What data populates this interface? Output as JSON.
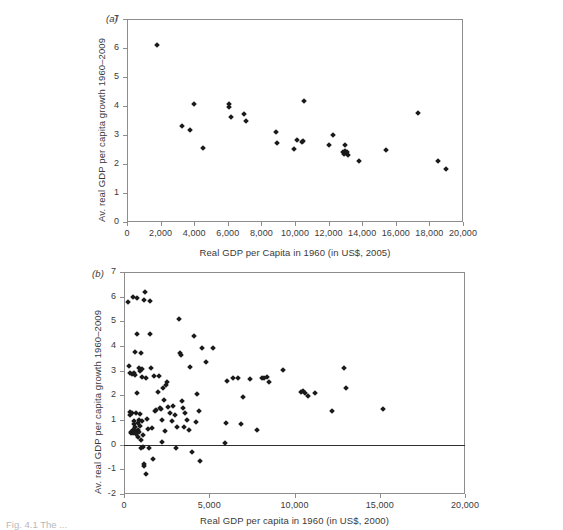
{
  "figure": {
    "caption_fragment": "Fig. 4.1 The ..."
  },
  "chart_data": [
    {
      "type": "scatter",
      "panel_label": "(a)",
      "title": "",
      "xlabel": "Real GDP per Capita in 1960 (in US$, 2005)",
      "ylabel": "Av. real GDP per capita growth 1960–2009",
      "xlim": [
        0,
        20000
      ],
      "ylim": [
        0,
        7
      ],
      "xticks": [
        0,
        2000,
        4000,
        6000,
        8000,
        10000,
        12000,
        14000,
        16000,
        18000,
        20000
      ],
      "xticklabels": [
        "0",
        "2,000",
        "4,000",
        "6,000",
        "8,000",
        "10,000",
        "12,000",
        "14,000",
        "16,000",
        "18,000",
        "20,000"
      ],
      "yticks": [
        0,
        1,
        2,
        3,
        4,
        5,
        6,
        7
      ],
      "yticklabels": [
        "0",
        "1",
        "2",
        "3",
        "4",
        "5",
        "6",
        "7"
      ],
      "grid": false,
      "legend": null,
      "marker": "diamond",
      "marker_color": "#1a1a1a",
      "zero_line": false,
      "points": [
        [
          1800,
          6.1
        ],
        [
          3300,
          3.31
        ],
        [
          3750,
          3.18
        ],
        [
          4000,
          4.06
        ],
        [
          4550,
          2.56
        ],
        [
          6050,
          4.08
        ],
        [
          6060,
          3.96
        ],
        [
          6180,
          3.61
        ],
        [
          6950,
          3.74
        ],
        [
          7100,
          3.47
        ],
        [
          8850,
          3.1
        ],
        [
          8950,
          2.71
        ],
        [
          9950,
          2.52
        ],
        [
          10100,
          2.83
        ],
        [
          10400,
          2.77
        ],
        [
          10500,
          2.78
        ],
        [
          10550,
          4.16
        ],
        [
          12050,
          2.67
        ],
        [
          12250,
          3.01
        ],
        [
          12850,
          2.4
        ],
        [
          12900,
          2.35
        ],
        [
          12950,
          2.45
        ],
        [
          13000,
          2.64
        ],
        [
          13050,
          2.38
        ],
        [
          13100,
          2.42
        ],
        [
          13150,
          2.3
        ],
        [
          13800,
          2.09
        ],
        [
          15400,
          2.47
        ],
        [
          17300,
          3.77
        ],
        [
          18500,
          2.1
        ],
        [
          19000,
          1.83
        ]
      ]
    },
    {
      "type": "scatter",
      "panel_label": "(b)",
      "title": "",
      "xlabel": "Real GDP per capita in 1960 (in US$, 2000)",
      "ylabel": "Av. real GDP per capita growth 1960–2009",
      "xlim": [
        0,
        20000
      ],
      "ylim": [
        -2,
        7
      ],
      "xticks": [
        0,
        5000,
        10000,
        15000,
        20000
      ],
      "xticklabels": [
        "0",
        "5,000",
        "10,000",
        "15,000",
        "20,000"
      ],
      "yticks": [
        -2,
        -1,
        0,
        1,
        2,
        3,
        4,
        5,
        6,
        7
      ],
      "yticklabels": [
        "-2",
        "-1",
        "0",
        "1",
        "2",
        "3",
        "4",
        "5",
        "6",
        "7"
      ],
      "grid": false,
      "legend": null,
      "marker": "diamond",
      "marker_color": "#1a1a1a",
      "zero_line": true,
      "points": [
        [
          230,
          5.8
        ],
        [
          300,
          3.19
        ],
        [
          330,
          2.9
        ],
        [
          350,
          1.32
        ],
        [
          380,
          1.22
        ],
        [
          400,
          0.52
        ],
        [
          420,
          0.46
        ],
        [
          450,
          2.86
        ],
        [
          470,
          1.28
        ],
        [
          500,
          0.6
        ],
        [
          520,
          0.48
        ],
        [
          540,
          6.0
        ],
        [
          560,
          2.92
        ],
        [
          580,
          0.95
        ],
        [
          600,
          0.82
        ],
        [
          620,
          0.7
        ],
        [
          640,
          3.75
        ],
        [
          660,
          2.82
        ],
        [
          680,
          1.3
        ],
        [
          700,
          0.55
        ],
        [
          720,
          0.42
        ],
        [
          740,
          5.95
        ],
        [
          760,
          4.5
        ],
        [
          780,
          2.1
        ],
        [
          800,
          0.88
        ],
        [
          820,
          0.6
        ],
        [
          840,
          0.3
        ],
        [
          860,
          1.02
        ],
        [
          880,
          0.5
        ],
        [
          900,
          3.1
        ],
        [
          920,
          2.98
        ],
        [
          940,
          1.25
        ],
        [
          960,
          0.75
        ],
        [
          980,
          0.2
        ],
        [
          1000,
          -0.15
        ],
        [
          1020,
          3.72
        ],
        [
          1040,
          3.08
        ],
        [
          1060,
          2.75
        ],
        [
          1080,
          0.95
        ],
        [
          1100,
          0.38
        ],
        [
          1120,
          -0.1
        ],
        [
          1150,
          -0.8
        ],
        [
          1180,
          -0.88
        ],
        [
          1200,
          5.88
        ],
        [
          1250,
          6.2
        ],
        [
          1280,
          -1.18
        ],
        [
          1300,
          2.72
        ],
        [
          1350,
          1.05
        ],
        [
          1400,
          0.62
        ],
        [
          1450,
          -0.12
        ],
        [
          1500,
          5.82
        ],
        [
          1550,
          4.48
        ],
        [
          1600,
          3.1
        ],
        [
          1650,
          0.68
        ],
        [
          1700,
          -0.6
        ],
        [
          1750,
          2.78
        ],
        [
          1800,
          1.38
        ],
        [
          1900,
          1.42
        ],
        [
          2000,
          2.12
        ],
        [
          2050,
          2.8
        ],
        [
          2100,
          1.48
        ],
        [
          2150,
          1.45
        ],
        [
          2200,
          0.98
        ],
        [
          2250,
          0.1
        ],
        [
          2300,
          2.3
        ],
        [
          2350,
          1.82
        ],
        [
          2400,
          0.55
        ],
        [
          2450,
          2.42
        ],
        [
          2500,
          2.55
        ],
        [
          2600,
          1.52
        ],
        [
          2700,
          1.3
        ],
        [
          2800,
          0.95
        ],
        [
          2900,
          1.58
        ],
        [
          3000,
          1.22
        ],
        [
          3050,
          -0.14
        ],
        [
          3100,
          0.7
        ],
        [
          3200,
          5.08
        ],
        [
          3300,
          3.7
        ],
        [
          3350,
          3.62
        ],
        [
          3400,
          1.78
        ],
        [
          3450,
          1.5
        ],
        [
          3500,
          0.72
        ],
        [
          3600,
          1.28
        ],
        [
          3700,
          1.0
        ],
        [
          3800,
          0.6
        ],
        [
          3900,
          3.15
        ],
        [
          4000,
          -0.28
        ],
        [
          4100,
          4.4
        ],
        [
          4200,
          0.92
        ],
        [
          4300,
          2.05
        ],
        [
          4400,
          1.38
        ],
        [
          4450,
          -0.66
        ],
        [
          4600,
          3.9
        ],
        [
          4800,
          3.35
        ],
        [
          5200,
          3.92
        ],
        [
          5900,
          0.08
        ],
        [
          6000,
          0.88
        ],
        [
          6050,
          2.6
        ],
        [
          6400,
          2.72
        ],
        [
          6700,
          2.72
        ],
        [
          6850,
          0.85
        ],
        [
          7000,
          1.92
        ],
        [
          7400,
          2.68
        ],
        [
          7800,
          0.58
        ],
        [
          8100,
          2.7
        ],
        [
          8200,
          2.72
        ],
        [
          8400,
          2.75
        ],
        [
          8500,
          2.55
        ],
        [
          9300,
          3.02
        ],
        [
          10400,
          2.12
        ],
        [
          10500,
          2.18
        ],
        [
          10600,
          2.1
        ],
        [
          10800,
          1.98
        ],
        [
          11200,
          2.08
        ],
        [
          12200,
          1.38
        ],
        [
          12900,
          3.1
        ],
        [
          13000,
          2.28
        ],
        [
          15200,
          1.45
        ]
      ]
    }
  ]
}
